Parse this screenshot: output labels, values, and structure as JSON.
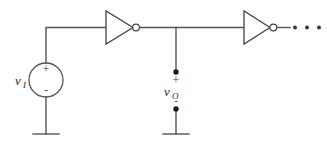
{
  "figure": {
    "kind": "circuit-schematic",
    "background_color": "#ffffff",
    "line_color": "#555555",
    "label_color": "#2b2b2b"
  },
  "source": {
    "name": "independent-voltage-source",
    "label_main": "v",
    "label_sub": "I",
    "plus_sign": "+",
    "minus_sign": "-"
  },
  "output": {
    "name": "output-port",
    "label_main": "v",
    "label_sub": "O",
    "plus_sign": "+",
    "minus_sign": "-"
  },
  "gates": [
    {
      "name": "inverter-1",
      "type": "inverter",
      "label": ""
    },
    {
      "name": "inverter-2",
      "type": "inverter",
      "label": ""
    }
  ],
  "continuation": {
    "name": "ellipsis",
    "text": "· · ·",
    "dot_count": 3
  },
  "grounds": [
    {
      "name": "ground-source"
    },
    {
      "name": "ground-output"
    }
  ]
}
